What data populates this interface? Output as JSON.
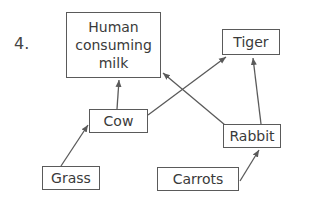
{
  "question_number": "4.",
  "nodes": {
    "human": {
      "label": "Human consuming milk",
      "lines": [
        "Human",
        "consuming",
        "milk"
      ]
    },
    "tiger": {
      "label": "Tiger"
    },
    "cow": {
      "label": "Cow"
    },
    "rabbit": {
      "label": "Rabbit"
    },
    "grass": {
      "label": "Grass"
    },
    "carrots": {
      "label": "Carrots"
    }
  },
  "edges": [
    {
      "from": "Grass",
      "to": "Cow"
    },
    {
      "from": "Cow",
      "to": "Human consuming milk"
    },
    {
      "from": "Cow",
      "to": "Tiger"
    },
    {
      "from": "Rabbit",
      "to": "Human consuming milk"
    },
    {
      "from": "Rabbit",
      "to": "Tiger"
    },
    {
      "from": "Carrots",
      "to": "Rabbit"
    }
  ],
  "colors": {
    "line": "#5a5a5a",
    "text": "#3a3a3a"
  }
}
